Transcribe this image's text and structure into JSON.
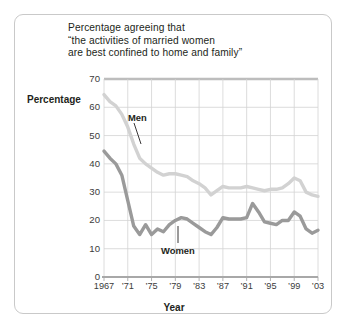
{
  "chart_data": {
    "type": "line",
    "title": "Percentage agreeing that “the activities of married women are best confined to home and family”",
    "title_lines": [
      "Percentage agreeing that",
      "“the activities of married women",
      "are best confined to home and family”"
    ],
    "xlabel": "Year",
    "ylabel": "Percentage",
    "xlim": [
      1967,
      2003
    ],
    "ylim": [
      0,
      70
    ],
    "yticks": [
      70,
      60,
      50,
      40,
      30,
      20,
      10,
      0
    ],
    "ytick_labels": [
      "70",
      "60",
      "50",
      "40",
      "30",
      "20",
      "10",
      "0"
    ],
    "xticks": [
      1967,
      1971,
      1975,
      1979,
      1983,
      1987,
      1991,
      1995,
      1999,
      2003
    ],
    "xtick_labels": [
      "1967",
      "’71",
      "’75",
      "’79",
      "’83",
      "’87",
      "’91",
      "’95",
      "’99",
      "’03"
    ],
    "grid": true,
    "grid_color": "#d3d3d3",
    "legend_position": "inline-annotation",
    "series": [
      {
        "name": "Men",
        "color": "#d2d2d2",
        "x": [
          1967,
          1968,
          1969,
          1970,
          1971,
          1972,
          1973,
          1974,
          1975,
          1976,
          1977,
          1978,
          1979,
          1980,
          1981,
          1982,
          1983,
          1984,
          1985,
          1986,
          1987,
          1988,
          1989,
          1990,
          1991,
          1992,
          1993,
          1994,
          1995,
          1996,
          1997,
          1998,
          1999,
          2000,
          2001,
          2002,
          2003
        ],
        "values": [
          64.5,
          62.0,
          60.5,
          57.5,
          53.0,
          47.0,
          42.0,
          40.0,
          38.5,
          37.0,
          36.0,
          36.5,
          36.5,
          36.0,
          35.5,
          34.0,
          33.0,
          31.5,
          29.0,
          30.5,
          32.0,
          31.5,
          31.5,
          31.5,
          32.0,
          31.5,
          31.0,
          30.5,
          31.0,
          31.0,
          31.5,
          33.0,
          35.0,
          34.0,
          30.0,
          29.0,
          28.5
        ]
      },
      {
        "name": "Women",
        "color": "#9a9a9a",
        "x": [
          1967,
          1968,
          1969,
          1970,
          1971,
          1972,
          1973,
          1974,
          1975,
          1976,
          1977,
          1978,
          1979,
          1980,
          1981,
          1982,
          1983,
          1984,
          1985,
          1986,
          1987,
          1988,
          1989,
          1990,
          1991,
          1992,
          1993,
          1994,
          1995,
          1996,
          1997,
          1998,
          1999,
          2000,
          2001,
          2002,
          2003
        ],
        "values": [
          44.5,
          42.0,
          40.0,
          36.0,
          27.0,
          18.0,
          15.0,
          18.5,
          15.0,
          17.0,
          16.0,
          18.5,
          20.0,
          21.0,
          20.5,
          19.0,
          17.5,
          16.0,
          15.0,
          17.5,
          21.0,
          20.5,
          20.5,
          20.5,
          21.0,
          26.0,
          23.0,
          19.5,
          19.0,
          18.5,
          20.0,
          20.0,
          23.0,
          21.5,
          17.0,
          15.5,
          16.5
        ]
      }
    ],
    "annotations": [
      {
        "text": "Men",
        "series": "Men"
      },
      {
        "text": "Women",
        "series": "Women"
      }
    ]
  }
}
